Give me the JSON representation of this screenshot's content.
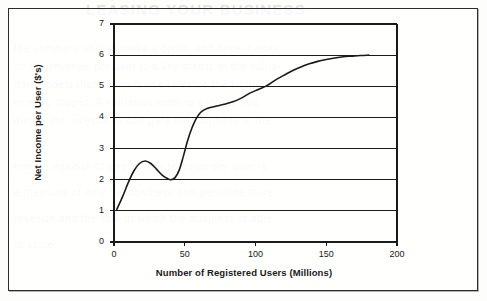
{
  "page": {
    "background_color": "#ffffff",
    "frame_border_color": "#2b2b2b",
    "bleed_through": {
      "title": "LEASING YOUR BUSINESS",
      "lines": [
        "the company should make a profit, and once it does",
        "so the revenue per user is a key metric in the valua-",
        "tion models that analysts use to value the business",
        "in early stages. A valuation method such as this",
        "allows the investor to compare the business in the",
        "market against its peers. The revenue per user is",
        "a measure of how the business can generate more",
        "revenue and the rate at which the business is able",
        "to scale."
      ]
    }
  },
  "chart_data": {
    "type": "line",
    "title": "",
    "subtitle": "",
    "xlabel": "Number of Registered Users (Millions)",
    "ylabel": "Net Income per User ($'s)",
    "xlim": [
      0,
      200
    ],
    "ylim": [
      0,
      7
    ],
    "xticks": [
      0,
      50,
      100,
      150,
      200
    ],
    "yticks": [
      0,
      1,
      2,
      3,
      4,
      5,
      6,
      7
    ],
    "xtick_labels": [
      "0",
      "50",
      "100",
      "150",
      "200"
    ],
    "ytick_labels": [
      "0",
      "1",
      "2",
      "3",
      "4",
      "5",
      "6",
      "7"
    ],
    "grid": {
      "horizontal": true,
      "vertical": false,
      "color": "#1a1a1a"
    },
    "legend": {
      "visible": false,
      "position": "none",
      "entries": []
    },
    "annotations": [],
    "line_color": "#1a1a1a",
    "line_width": 1.6,
    "series": [
      {
        "name": "Net income per user",
        "x": [
          2,
          6,
          10,
          14,
          18,
          22,
          26,
          30,
          34,
          38,
          40,
          43,
          46,
          49,
          52,
          55,
          58,
          61,
          64,
          68,
          72,
          78,
          84,
          90,
          96,
          102,
          108,
          114,
          120,
          126,
          132,
          138,
          144,
          150,
          156,
          162,
          168,
          174,
          180
        ],
        "y": [
          1.05,
          1.45,
          1.9,
          2.28,
          2.52,
          2.6,
          2.52,
          2.34,
          2.15,
          2.03,
          2.0,
          2.06,
          2.3,
          2.75,
          3.25,
          3.65,
          3.95,
          4.15,
          4.25,
          4.32,
          4.36,
          4.42,
          4.5,
          4.62,
          4.78,
          4.9,
          5.02,
          5.2,
          5.35,
          5.5,
          5.62,
          5.72,
          5.8,
          5.86,
          5.91,
          5.95,
          5.97,
          5.99,
          6.0
        ]
      }
    ]
  },
  "axes": {
    "y_title": "Net Income per User ($'s)",
    "x_title": "Number of Registered Users (Millions)"
  }
}
